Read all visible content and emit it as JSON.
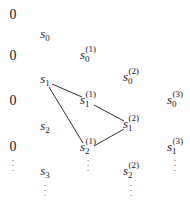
{
  "diagram": {
    "zero_column": {
      "label": "0",
      "rows": [
        {
          "text": "0",
          "x": 13,
          "y": 15
        },
        {
          "text": "0",
          "x": 13,
          "y": 56
        },
        {
          "text": "0",
          "x": 13,
          "y": 101
        },
        {
          "text": "0",
          "x": 13,
          "y": 147
        }
      ],
      "dots": {
        "x": 13,
        "y": 158
      }
    },
    "nodes": [
      {
        "id": "s0",
        "base": "s",
        "sub": "0",
        "sup": "",
        "x": 45,
        "y": 35
      },
      {
        "id": "s1",
        "base": "s",
        "sub": "1",
        "sup": "",
        "x": 45,
        "y": 80
      },
      {
        "id": "s2",
        "base": "s",
        "sub": "2",
        "sup": "",
        "x": 45,
        "y": 127
      },
      {
        "id": "s3",
        "base": "s",
        "sub": "3",
        "sup": "",
        "x": 45,
        "y": 172
      },
      {
        "id": "s0_1",
        "base": "s",
        "sub": "0",
        "sup": "(1)",
        "x": 88,
        "y": 56
      },
      {
        "id": "s1_1",
        "base": "s",
        "sub": "1",
        "sup": "(1)",
        "x": 88,
        "y": 101
      },
      {
        "id": "s2_1",
        "base": "s",
        "sub": "2",
        "sup": "(1)",
        "x": 88,
        "y": 148
      },
      {
        "id": "s0_2",
        "base": "s",
        "sub": "0",
        "sup": "(2)",
        "x": 131,
        "y": 78
      },
      {
        "id": "s1_2",
        "base": "s",
        "sub": "1",
        "sup": "(2)",
        "x": 131,
        "y": 125
      },
      {
        "id": "s2_2",
        "base": "s",
        "sub": "2",
        "sup": "(2)",
        "x": 131,
        "y": 172
      },
      {
        "id": "s0_3",
        "base": "s",
        "sub": "0",
        "sup": "(3)",
        "x": 175,
        "y": 101
      },
      {
        "id": "s1_3",
        "base": "s",
        "sub": "1",
        "sup": "(3)",
        "x": 175,
        "y": 148
      }
    ],
    "edges": [
      {
        "from": "s1",
        "to": "s1_1",
        "x1": 52,
        "y1": 84,
        "x2": 82,
        "y2": 97
      },
      {
        "from": "s1",
        "to": "s2_1",
        "x1": 49,
        "y1": 87,
        "x2": 83,
        "y2": 143
      },
      {
        "from": "s1_1",
        "to": "s1_2",
        "x1": 94,
        "y1": 105,
        "x2": 124,
        "y2": 121
      },
      {
        "from": "s2_1",
        "to": "s1_2",
        "x1": 94,
        "y1": 146,
        "x2": 124,
        "y2": 129
      }
    ],
    "continuation_dots": [
      {
        "below": "s3",
        "x": 45,
        "y": 183
      },
      {
        "below": "s2_1",
        "x": 88,
        "y": 158
      },
      {
        "below": "s2_2",
        "x": 131,
        "y": 183
      },
      {
        "below": "s1_3",
        "x": 175,
        "y": 158
      }
    ],
    "dots_glyph": "·\n·\n·",
    "colors": {
      "ink": "#222222",
      "edge": "#333333",
      "background": "#ffffff"
    }
  }
}
